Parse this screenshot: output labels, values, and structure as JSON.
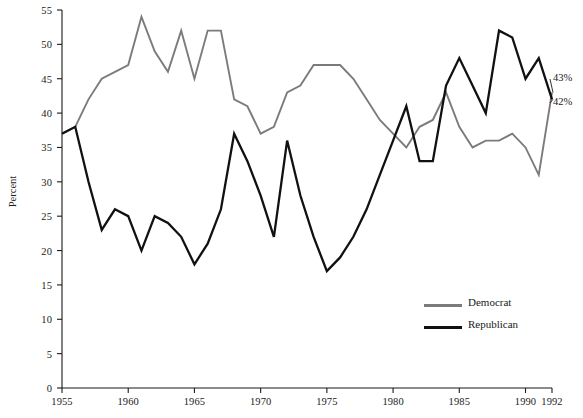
{
  "chart_data": {
    "type": "line",
    "title": "",
    "xlabel": "",
    "ylabel": "Percent",
    "xlim": [
      1955,
      1992
    ],
    "ylim": [
      0,
      55
    ],
    "ytick_step": 5,
    "grid": false,
    "legend_position": "inside-lower-right",
    "xticks": [
      "1955",
      "1960",
      "1965",
      "1970",
      "1975",
      "1980",
      "1985",
      "1990",
      "1992"
    ],
    "xtick_values": [
      1955,
      1960,
      1965,
      1970,
      1975,
      1980,
      1985,
      1990,
      1992
    ],
    "yticks": [
      "0",
      "5",
      "10",
      "15",
      "20",
      "25",
      "30",
      "35",
      "40",
      "45",
      "50",
      "55"
    ],
    "ytick_values": [
      0,
      5,
      10,
      15,
      20,
      25,
      30,
      35,
      40,
      45,
      50,
      55
    ],
    "x": [
      1955,
      1956,
      1957,
      1958,
      1959,
      1960,
      1961,
      1962,
      1963,
      1964,
      1965,
      1966,
      1967,
      1968,
      1969,
      1970,
      1971,
      1972,
      1973,
      1974,
      1975,
      1976,
      1977,
      1978,
      1979,
      1980,
      1981,
      1982,
      1983,
      1984,
      1985,
      1986,
      1987,
      1988,
      1989,
      1990,
      1991,
      1992
    ],
    "series": [
      {
        "name": "Democrat",
        "color": "#7b7b7b",
        "values": [
          37,
          38,
          42,
          45,
          46,
          47,
          54,
          49,
          46,
          52,
          45,
          52,
          52,
          42,
          41,
          37,
          38,
          43,
          44,
          47,
          47,
          47,
          45,
          42,
          39,
          37,
          35,
          38,
          39,
          43,
          38,
          35,
          36,
          36,
          37,
          35,
          31,
          43
        ]
      },
      {
        "name": "Republican",
        "color": "#111111",
        "values": [
          37,
          38,
          30,
          23,
          26,
          25,
          20,
          25,
          24,
          22,
          18,
          21,
          26,
          37,
          33,
          28,
          22,
          36,
          28,
          22,
          17,
          19,
          22,
          26,
          31,
          36,
          41,
          33,
          33,
          44,
          48,
          44,
          40,
          52,
          51,
          45,
          48,
          42
        ]
      }
    ],
    "annotations": [
      {
        "text": "43%",
        "x": 1992,
        "y": 43,
        "series": "Democrat"
      },
      {
        "text": "42%",
        "x": 1992,
        "y": 42,
        "series": "Republican"
      }
    ]
  },
  "legend": {
    "items": [
      {
        "label": "Democrat"
      },
      {
        "label": "Republican"
      }
    ]
  }
}
